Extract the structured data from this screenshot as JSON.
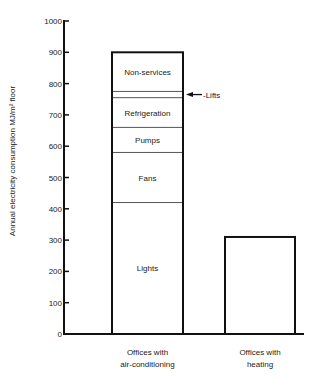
{
  "chart_data": {
    "type": "bar",
    "stacked": true,
    "title": "",
    "xlabel": "",
    "ylabel": "Annual electricity consumption  MJ/m² floor",
    "ylim": [
      0,
      1000
    ],
    "yticks": [
      0,
      100,
      200,
      300,
      400,
      500,
      600,
      700,
      800,
      900,
      1000
    ],
    "grid": false,
    "legend": "none (segments labelled inside bar)",
    "categories": [
      "Offices with air-conditioning",
      "Offices with heating"
    ],
    "category_label_lines": [
      [
        "Offices with",
        "air-conditioning"
      ],
      [
        "Offices with",
        "heating"
      ]
    ],
    "series": [
      {
        "name": "Lights",
        "values": [
          420,
          310
        ]
      },
      {
        "name": "Fans",
        "values": [
          160,
          0
        ]
      },
      {
        "name": "Pumps",
        "values": [
          80,
          0
        ]
      },
      {
        "name": "Refrigeration",
        "values": [
          95,
          0
        ]
      },
      {
        "name": "Lifts",
        "values": [
          20,
          0
        ]
      },
      {
        "name": "Non-services",
        "values": [
          125,
          0
        ]
      }
    ],
    "totals": [
      900,
      310
    ],
    "annotations": [
      {
        "text": "Lifts",
        "arrow": "left",
        "target": "Lifts segment of air-conditioning bar"
      }
    ]
  }
}
